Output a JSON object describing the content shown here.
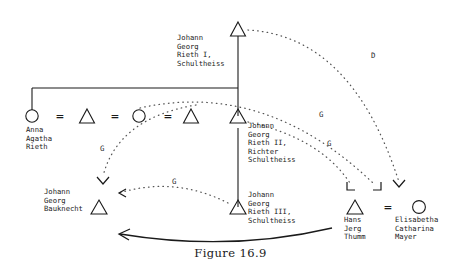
{
  "figure": {
    "caption": "Figure 16.9"
  },
  "persons": [
    {
      "id": "rieth-i",
      "symbol": "triangle",
      "label": "Johann\nGeorg\nRieth I,\nSchultheiss",
      "label_lines": [
        "Johann",
        "Georg",
        "Rieth I,",
        "Schultheiss"
      ],
      "x": 238,
      "y": 22
    },
    {
      "id": "anna-agatha-rieth",
      "symbol": "circle",
      "label": "Anna\nAgatha\nRieth",
      "label_lines": [
        "Anna",
        "Agatha",
        "Rieth"
      ],
      "x": 32,
      "y": 116
    },
    {
      "id": "spouse-triangle-1",
      "symbol": "triangle",
      "label": "",
      "label_lines": [],
      "x": 87,
      "y": 116
    },
    {
      "id": "spouse-circle-2",
      "symbol": "circle",
      "label": "",
      "label_lines": [],
      "x": 139,
      "y": 116
    },
    {
      "id": "spouse-triangle-2",
      "symbol": "triangle",
      "label": "",
      "label_lines": [],
      "x": 191,
      "y": 116
    },
    {
      "id": "rieth-ii",
      "symbol": "triangle",
      "label": "Johann\nGeorg\nRieth II,\nRichter\nSchultheiss",
      "label_lines": [
        "Johann",
        "Georg",
        "Rieth II,",
        "Richter",
        "Schultheiss"
      ],
      "x": 238,
      "y": 116
    },
    {
      "id": "rieth-iii",
      "symbol": "triangle",
      "label": "Johann\nGeorg\nRieth III,\nSchultheiss",
      "label_lines": [
        "Johann",
        "Georg",
        "Rieth III,",
        "Schultheiss"
      ],
      "x": 238,
      "y": 207
    },
    {
      "id": "bauknecht",
      "symbol": "triangle",
      "label": "Johann\nGeorg\nBauknecht",
      "label_lines": [
        "Johann",
        "Georg",
        "Bauknecht"
      ],
      "x": 99,
      "y": 207
    },
    {
      "id": "hans-jerg-thumm",
      "symbol": "triangle",
      "label": "Hans\nJerg\nThumm",
      "label_lines": [
        "Hans",
        "Jerg",
        "Thumm"
      ],
      "x": 355,
      "y": 207
    },
    {
      "id": "elisabetha-catharina-mayer",
      "symbol": "circle",
      "label": "Elisabetha\nCatharina\nMayer",
      "label_lines": [
        "Elisabetha",
        "Catharina",
        "Mayer"
      ],
      "x": 419,
      "y": 207
    }
  ],
  "marriage_signs": [
    {
      "id": "marriage-1",
      "glyph": "=",
      "x": 56,
      "y": 110
    },
    {
      "id": "marriage-2",
      "glyph": "=",
      "x": 111,
      "y": 110
    },
    {
      "id": "marriage-3",
      "glyph": "=",
      "x": 164,
      "y": 110
    },
    {
      "id": "marriage-4",
      "glyph": "=",
      "x": 387,
      "y": 201
    }
  ],
  "arc_labels": [
    {
      "id": "arc-label-d",
      "text": "D",
      "x": 371,
      "y": 55
    },
    {
      "id": "arc-label-g-right-upper",
      "text": "G",
      "x": 319,
      "y": 114
    },
    {
      "id": "arc-label-g-right-lower",
      "text": "G",
      "x": 327,
      "y": 143
    },
    {
      "id": "arc-label-g-left",
      "text": "G",
      "x": 100,
      "y": 148
    },
    {
      "id": "arc-label-g-bottom",
      "text": "G",
      "x": 172,
      "y": 181
    }
  ],
  "link_descriptions": {
    "descent-line-rieth-i": "vertical descent from Johann Georg Rieth I",
    "sibling-bar": "horizontal sibling bar to Anna Agatha Rieth and Rieth II",
    "descent-line-rieth-ii": "vertical descent from Rieth II to Rieth III",
    "dotted-arc-d": "dotted godparent arc labelled D from Rieth I to Elisabetha Catharina Mayer",
    "dotted-arc-g-1": "dotted arc labelled G from Rieth II toward Hans Jerg Thumm",
    "dotted-arc-g-2": "dotted arc labelled G from marriage row toward Hans Jerg Thumm",
    "dotted-arc-g-3": "dotted arc labelled G descending to Johann Georg Bauknecht",
    "dotted-arc-g-4": "dotted arc labelled G from Rieth III to Bauknecht",
    "solid-arrow-bottom": "solid curved arrow from Hans Jerg Thumm to Johann Georg Bauknecht"
  },
  "colors": {
    "ink": "#1a1a1a",
    "dotted": "#4d4d4d",
    "background": "#ffffff"
  }
}
